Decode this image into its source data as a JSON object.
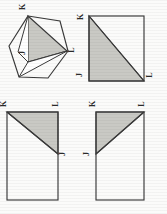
{
  "page": {
    "orientation": "rotated-90-ccw",
    "background_color": "#fbfbfa",
    "ink_color": "#3a3a3a",
    "shade_color": "#c9c9c4"
  },
  "figures": [
    {
      "id": "figure-hexagon",
      "shape": "hexagon",
      "description": "Hexagon with inscribed shaded triangle and folded flap",
      "labels": [
        {
          "name": "label-k",
          "text": "K",
          "position": "top-vertex"
        },
        {
          "name": "label-l",
          "text": "L",
          "position": "right-vertex"
        },
        {
          "name": "label-j",
          "text": "J",
          "position": "interior-lower-left"
        }
      ]
    },
    {
      "id": "figure-rect-top-right",
      "shape": "rectangle",
      "description": "Rectangle with diagonal from top-left to bottom-right; lower-left triangle shaded",
      "labels": [
        {
          "name": "label-k",
          "text": "K",
          "position": "top-left"
        },
        {
          "name": "label-j",
          "text": "J",
          "position": "bottom-left"
        },
        {
          "name": "label-l",
          "text": "L",
          "position": "bottom-right"
        }
      ]
    },
    {
      "id": "figure-rect-bottom-left",
      "shape": "rectangle",
      "description": "Rectangle with diagonal from top-left to right mid-edge; upper triangle shaded",
      "labels": [
        {
          "name": "label-k",
          "text": "K",
          "position": "top-left"
        },
        {
          "name": "label-l",
          "text": "L",
          "position": "top-right"
        },
        {
          "name": "label-j",
          "text": "J",
          "position": "right-middle"
        }
      ]
    },
    {
      "id": "figure-rect-bottom-right",
      "shape": "rectangle",
      "description": "Rectangle with diagonal from left mid-edge to top-right; upper-left triangle shaded",
      "labels": [
        {
          "name": "label-k",
          "text": "K",
          "position": "top-left"
        },
        {
          "name": "label-l",
          "text": "L",
          "position": "top-right"
        },
        {
          "name": "label-j",
          "text": "J",
          "position": "left-middle"
        }
      ]
    }
  ]
}
